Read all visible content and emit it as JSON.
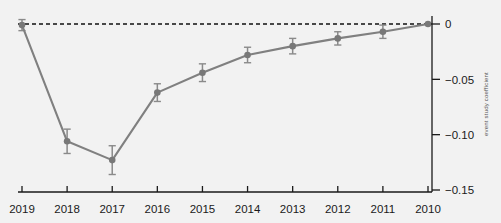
{
  "chart_data": {
    "type": "line",
    "title": "",
    "subtitle": "",
    "xlabel": "",
    "ylabel": "event study coefficient",
    "categories": [
      "2019",
      "2018",
      "2017",
      "2016",
      "2015",
      "2014",
      "2013",
      "2012",
      "2011",
      "2010"
    ],
    "values": [
      -0.001,
      -0.106,
      -0.123,
      -0.062,
      -0.044,
      -0.028,
      -0.02,
      -0.013,
      -0.007,
      0.0
    ],
    "error_low": [
      -0.006,
      -0.117,
      -0.136,
      -0.07,
      -0.052,
      -0.035,
      -0.027,
      -0.019,
      -0.013,
      0.0
    ],
    "error_high": [
      0.004,
      -0.095,
      -0.11,
      -0.054,
      -0.036,
      -0.021,
      -0.013,
      -0.007,
      -0.001,
      0.0
    ],
    "ylim": [
      -0.15,
      0.01
    ],
    "yticks": [
      0,
      -0.05,
      -0.1,
      -0.15
    ],
    "ytick_labels": [
      "0",
      "−0.05",
      "−0.10",
      "−0.15"
    ],
    "xtick_labels": [
      "2019",
      "2018",
      "2017",
      "2016",
      "2015",
      "2014",
      "2013",
      "2012",
      "2011",
      "2010"
    ],
    "grid": false,
    "legend": "none",
    "y_axis_position": "right",
    "reference_line": {
      "value": 0,
      "style": "dashed"
    },
    "series": [
      {
        "name": "estimate",
        "values": [
          -0.001,
          -0.106,
          -0.123,
          -0.062,
          -0.044,
          -0.028,
          -0.02,
          -0.013,
          -0.007,
          0.0
        ]
      }
    ]
  },
  "colors": {
    "line": "#808080",
    "marker": "#787878",
    "error_bar": "#8a8a8a",
    "axis": "#1a1a1a",
    "reference_line": "#111111",
    "background": "#f2f2f2",
    "tick_text": "#1a1a1a",
    "axis_title_text": "#555555"
  },
  "axis_label_right": "event study coefficient"
}
